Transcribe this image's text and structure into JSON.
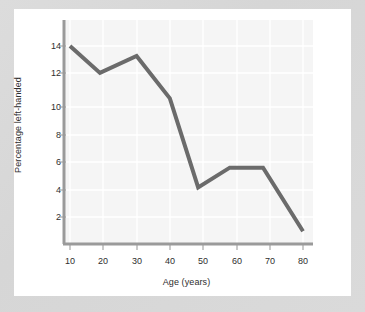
{
  "chart_data": {
    "type": "line",
    "title": "",
    "xlabel": "Age (years)",
    "ylabel": "Percentage left-handed",
    "xlim": [
      5,
      83
    ],
    "ylim": [
      0,
      15.7
    ],
    "xticks": [
      10,
      20,
      30,
      40,
      50,
      60,
      70,
      80
    ],
    "yticks": [
      2,
      4,
      6,
      8,
      10,
      12,
      14
    ],
    "grid": true,
    "legend": "none",
    "series": [
      {
        "name": "Percentage left-handed",
        "color": "#6b6b6b",
        "x": [
          10,
          19,
          30,
          40,
          48.5,
          58,
          68,
          80
        ],
        "values": [
          14.0,
          12.1,
          13.3,
          10.3,
          4.0,
          5.4,
          5.4,
          0.9
        ]
      }
    ]
  },
  "axes": {
    "x_title": "Age (years)",
    "y_title": "Percentage left-handed",
    "x_tick_labels": [
      "10",
      "20",
      "30",
      "40",
      "50",
      "60",
      "70",
      "80"
    ],
    "y_tick_labels": [
      "2",
      "4",
      "6",
      "8",
      "10",
      "12",
      "14"
    ]
  },
  "colors": {
    "line": "#6b6b6b",
    "plot_background": "#f5f5f5",
    "gridline": "#ffffff",
    "axis": "#9a9a9a",
    "card": "#ffffff",
    "page": "#d9d9d9",
    "text": "#2e2e2e"
  }
}
